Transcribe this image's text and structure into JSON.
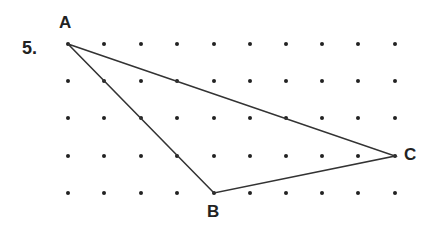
{
  "problem": {
    "number": "5."
  },
  "grid": {
    "columns": 10,
    "rows": 5,
    "x": [
      68,
      104,
      141,
      177,
      214,
      250,
      286,
      322,
      358,
      395
    ],
    "y": [
      44,
      81,
      118,
      156,
      193
    ],
    "dot_color": "#222222"
  },
  "triangle": {
    "stroke": "#333333",
    "vertices": [
      {
        "label": "A",
        "col": 0,
        "row": 0
      },
      {
        "label": "B",
        "col": 4,
        "row": 4
      },
      {
        "label": "C",
        "col": 9,
        "row": 3
      }
    ]
  },
  "labels": {
    "A": "A",
    "B": "B",
    "C": "C"
  }
}
